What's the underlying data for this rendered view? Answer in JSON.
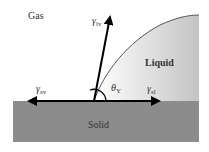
{
  "diagram": {
    "type": "contact-angle-young-equation",
    "regions": {
      "gas": "Gas",
      "liquid": "Liquid",
      "solid": "Solid"
    },
    "forces": {
      "lv": {
        "symbol": "γ",
        "subscript": "lv"
      },
      "sv": {
        "symbol": "γ",
        "subscript": "sv"
      },
      "sl": {
        "symbol": "γ",
        "subscript": "sl"
      }
    },
    "angle": {
      "symbol": "θ",
      "subscript": "Y"
    },
    "colors": {
      "solid": "#8c8c8c",
      "liquid_start": "#ffffff",
      "liquid_end": "#c4c4c4",
      "arrow": "#000000",
      "curve": "#555555",
      "text": "#333333"
    }
  }
}
